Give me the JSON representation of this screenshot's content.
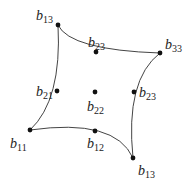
{
  "diagram": {
    "type": "bezier-patch-control-net",
    "curve_color": "#444444",
    "point_color": "#111111",
    "edges": [
      {
        "name": "top",
        "from": [
          58,
          25
        ],
        "ctrl": [
          70,
          50
        ],
        "to": [
          160,
          53
        ]
      },
      {
        "name": "left",
        "from": [
          58,
          25
        ],
        "ctrl": [
          62,
          100
        ],
        "to": [
          30,
          130
        ]
      },
      {
        "name": "right",
        "from": [
          160,
          53
        ],
        "ctrl": [
          125,
          80
        ],
        "to": [
          133,
          158
        ]
      },
      {
        "name": "bottom",
        "from": [
          30,
          130
        ],
        "ctrl": [
          115,
          118
        ],
        "to": [
          133,
          158
        ]
      }
    ],
    "points": [
      {
        "id": "b13_top",
        "x": 58,
        "y": 25,
        "base": "b",
        "sub": "13",
        "lx": 36,
        "ly": 20
      },
      {
        "id": "b23_top",
        "x": 96,
        "y": 52,
        "base": "b",
        "sub": "23",
        "lx": 88,
        "ly": 47
      },
      {
        "id": "b33",
        "x": 160,
        "y": 53,
        "base": "b",
        "sub": "33",
        "lx": 165,
        "ly": 49
      },
      {
        "id": "b21",
        "x": 57,
        "y": 91,
        "base": "b",
        "sub": "21",
        "lx": 36,
        "ly": 96
      },
      {
        "id": "b22",
        "x": 95,
        "y": 92,
        "base": "b",
        "sub": "22",
        "lx": 87,
        "ly": 111
      },
      {
        "id": "b23_right",
        "x": 134,
        "y": 92,
        "base": "b",
        "sub": "23",
        "lx": 139,
        "ly": 97
      },
      {
        "id": "b11",
        "x": 30,
        "y": 130,
        "base": "b",
        "sub": "11",
        "lx": 10,
        "ly": 148
      },
      {
        "id": "b12",
        "x": 95,
        "y": 131,
        "base": "b",
        "sub": "12",
        "lx": 87,
        "ly": 148
      },
      {
        "id": "b13_bottom",
        "x": 133,
        "y": 158,
        "base": "b",
        "sub": "13",
        "lx": 138,
        "ly": 175
      }
    ]
  }
}
